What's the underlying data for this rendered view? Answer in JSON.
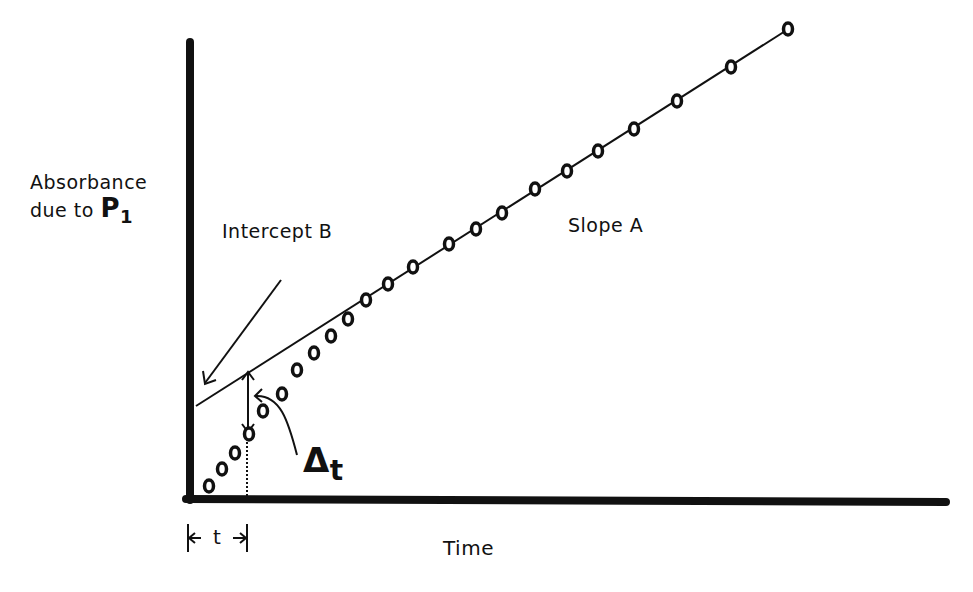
{
  "diagram": {
    "y_axis_label_line1": "Absorbance",
    "y_axis_label_line2_prefix": "due to",
    "y_axis_label_symbol": "P",
    "y_axis_label_subscript": "1",
    "x_axis_label": "Time",
    "intercept_label": "Intercept B",
    "slope_label": "Slope A",
    "delta_symbol": "Δ",
    "delta_subscript": "t",
    "lag_marker_label": "t",
    "line_color": "#111111",
    "background_color": "#ffffff"
  },
  "chart_data": {
    "type": "scatter",
    "title": "",
    "xlabel": "Time",
    "ylabel": "Absorbance due to P1",
    "axes_pixels": {
      "origin": [
        188,
        498
      ],
      "x_end": [
        948,
        498
      ],
      "y_top": [
        188,
        42
      ]
    },
    "fit_line": {
      "x1": 196,
      "y1": 406,
      "x2": 790,
      "y2": 28,
      "label_slope": "Slope A",
      "label_intercept": "Intercept B"
    },
    "points": [
      [
        209,
        486
      ],
      [
        222,
        469
      ],
      [
        235,
        453
      ],
      [
        249,
        434
      ],
      [
        263,
        411
      ],
      [
        282,
        394
      ],
      [
        297,
        370
      ],
      [
        314,
        353
      ],
      [
        331,
        336
      ],
      [
        348,
        319
      ],
      [
        366,
        300
      ],
      [
        388,
        284
      ],
      [
        413,
        267
      ],
      [
        449,
        244
      ],
      [
        476,
        229
      ],
      [
        502,
        213
      ],
      [
        535,
        189
      ],
      [
        567,
        171
      ],
      [
        598,
        151
      ],
      [
        634,
        129
      ],
      [
        677,
        101
      ],
      [
        731,
        67
      ],
      [
        788,
        29
      ]
    ],
    "lag_time_x": 247,
    "grid": false,
    "ticks": "none"
  }
}
